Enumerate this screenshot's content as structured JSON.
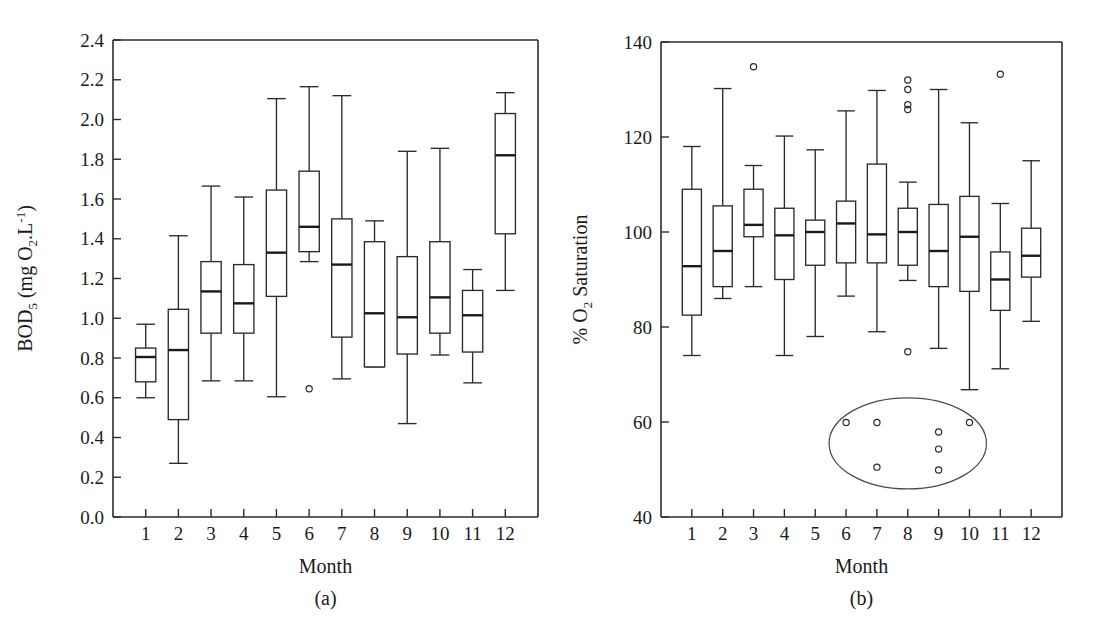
{
  "figure": {
    "background": "#ffffff",
    "ink_color": "#1a1a1a"
  },
  "chart_data": [
    {
      "type": "box",
      "panel_label": "(a)",
      "title": "",
      "xlabel": "Month",
      "ylabel": "BOD5 (mg O2.L-1)",
      "ylabel_parts": {
        "base": "BOD",
        "sub1": "5",
        "mid": " (mg O",
        "sub2": "2",
        "tail": ".L",
        "sup": "-1",
        "close": ")"
      },
      "categories": [
        "1",
        "2",
        "3",
        "4",
        "5",
        "6",
        "7",
        "8",
        "9",
        "10",
        "11",
        "12"
      ],
      "xtick_labels": [
        "1",
        "2",
        "3",
        "4",
        "5",
        "6",
        "7",
        "8",
        "9",
        "10",
        "11",
        "12"
      ],
      "ylim": [
        0.0,
        2.4
      ],
      "ytick_labels": [
        "0.0",
        "0.2",
        "0.4",
        "0.6",
        "0.8",
        "1.0",
        "1.2",
        "1.4",
        "1.6",
        "1.8",
        "2.0",
        "2.2",
        "2.4"
      ],
      "ytick_values": [
        0.0,
        0.2,
        0.4,
        0.6,
        0.8,
        1.0,
        1.2,
        1.4,
        1.6,
        1.8,
        2.0,
        2.2,
        2.4
      ],
      "grid": false,
      "legend": "none",
      "boxes": [
        {
          "category": "1",
          "whisker_low": 0.6,
          "q1": 0.68,
          "median": 0.805,
          "q3": 0.85,
          "whisker_high": 0.97,
          "outliers": []
        },
        {
          "category": "2",
          "whisker_low": 0.27,
          "q1": 0.49,
          "median": 0.84,
          "q3": 1.045,
          "whisker_high": 1.415,
          "outliers": []
        },
        {
          "category": "3",
          "whisker_low": 0.685,
          "q1": 0.925,
          "median": 1.135,
          "q3": 1.285,
          "whisker_high": 1.665,
          "outliers": []
        },
        {
          "category": "4",
          "whisker_low": 0.685,
          "q1": 0.925,
          "median": 1.075,
          "q3": 1.27,
          "whisker_high": 1.61,
          "outliers": []
        },
        {
          "category": "5",
          "whisker_low": 0.605,
          "q1": 1.11,
          "median": 1.33,
          "q3": 1.645,
          "whisker_high": 2.105,
          "outliers": []
        },
        {
          "category": "6",
          "whisker_low": 1.285,
          "q1": 1.335,
          "median": 1.46,
          "q3": 1.74,
          "whisker_high": 2.165,
          "outliers": [
            0.645
          ]
        },
        {
          "category": "7",
          "whisker_low": 0.695,
          "q1": 0.905,
          "median": 1.27,
          "q3": 1.5,
          "whisker_high": 2.12,
          "outliers": []
        },
        {
          "category": "8",
          "whisker_low": 0.755,
          "q1": 0.755,
          "median": 1.025,
          "q3": 1.385,
          "whisker_high": 1.49,
          "outliers": []
        },
        {
          "category": "9",
          "whisker_low": 0.47,
          "q1": 0.82,
          "median": 1.005,
          "q3": 1.31,
          "whisker_high": 1.84,
          "outliers": []
        },
        {
          "category": "10",
          "whisker_low": 0.815,
          "q1": 0.925,
          "median": 1.105,
          "q3": 1.385,
          "whisker_high": 1.855,
          "outliers": []
        },
        {
          "category": "11",
          "whisker_low": 0.675,
          "q1": 0.83,
          "median": 1.015,
          "q3": 1.14,
          "whisker_high": 1.245,
          "outliers": []
        },
        {
          "category": "12",
          "whisker_low": 1.14,
          "q1": 1.425,
          "median": 1.82,
          "q3": 2.03,
          "whisker_high": 2.135,
          "outliers": []
        }
      ],
      "annotations": []
    },
    {
      "type": "box",
      "panel_label": "(b)",
      "title": "",
      "xlabel": "Month",
      "ylabel": "% O2 Saturation",
      "ylabel_parts": {
        "base": "% O",
        "sub1": "2",
        "mid": " Saturation",
        "sub2": "",
        "tail": "",
        "sup": "",
        "close": ""
      },
      "categories": [
        "1",
        "2",
        "3",
        "4",
        "5",
        "6",
        "7",
        "8",
        "9",
        "10",
        "11",
        "12"
      ],
      "xtick_labels": [
        "1",
        "2",
        "3",
        "4",
        "5",
        "6",
        "7",
        "8",
        "9",
        "10",
        "11",
        "12"
      ],
      "ylim": [
        40,
        140
      ],
      "ytick_labels": [
        "40",
        "60",
        "80",
        "100",
        "120",
        "140"
      ],
      "ytick_values": [
        40,
        60,
        80,
        100,
        120,
        140
      ],
      "grid": false,
      "legend": "none",
      "boxes": [
        {
          "category": "1",
          "whisker_low": 74.0,
          "q1": 82.5,
          "median": 92.8,
          "q3": 109.0,
          "whisker_high": 118.0,
          "outliers": []
        },
        {
          "category": "2",
          "whisker_low": 86.0,
          "q1": 88.5,
          "median": 96.0,
          "q3": 105.5,
          "whisker_high": 130.2,
          "outliers": []
        },
        {
          "category": "3",
          "whisker_low": 88.5,
          "q1": 99.0,
          "median": 101.5,
          "q3": 109.0,
          "whisker_high": 114.0,
          "outliers": [
            134.8
          ]
        },
        {
          "category": "4",
          "whisker_low": 74.0,
          "q1": 90.0,
          "median": 99.3,
          "q3": 105.0,
          "whisker_high": 120.2,
          "outliers": []
        },
        {
          "category": "5",
          "whisker_low": 78.0,
          "q1": 93.0,
          "median": 100.0,
          "q3": 102.5,
          "whisker_high": 117.3,
          "outliers": []
        },
        {
          "category": "6",
          "whisker_low": 86.5,
          "q1": 93.5,
          "median": 101.8,
          "q3": 106.5,
          "whisker_high": 125.5,
          "outliers": []
        },
        {
          "category": "7",
          "whisker_low": 79.0,
          "q1": 93.5,
          "median": 99.5,
          "q3": 114.3,
          "whisker_high": 129.8,
          "outliers": []
        },
        {
          "category": "8",
          "whisker_low": 89.8,
          "q1": 93.0,
          "median": 100.0,
          "q3": 105.0,
          "whisker_high": 110.5,
          "outliers": [
            132.0,
            130.0,
            126.8,
            125.8,
            74.8
          ]
        },
        {
          "category": "9",
          "whisker_low": 75.5,
          "q1": 88.5,
          "median": 96.0,
          "q3": 105.8,
          "whisker_high": 130.0,
          "outliers": []
        },
        {
          "category": "10",
          "whisker_low": 66.8,
          "q1": 87.5,
          "median": 99.0,
          "q3": 107.5,
          "whisker_high": 123.0,
          "outliers": []
        },
        {
          "category": "11",
          "whisker_low": 71.2,
          "q1": 83.5,
          "median": 90.0,
          "q3": 95.8,
          "whisker_high": 106.0,
          "outliers": [
            133.2
          ]
        },
        {
          "category": "12",
          "whisker_low": 81.2,
          "q1": 90.5,
          "median": 95.0,
          "q3": 100.8,
          "whisker_high": 115.0,
          "outliers": []
        }
      ],
      "annotations": [
        {
          "kind": "ellipse",
          "name": "low-saturation-cluster-ellipse",
          "center_x_month": 8.0,
          "center_y": 55.5,
          "rx_months": 2.55,
          "ry_value": 9.6
        },
        {
          "kind": "point",
          "name": "cluster-point",
          "x_month": 6.0,
          "y": 59.9
        },
        {
          "kind": "point",
          "name": "cluster-point",
          "x_month": 7.0,
          "y": 59.9
        },
        {
          "kind": "point",
          "name": "cluster-point",
          "x_month": 7.0,
          "y": 50.5
        },
        {
          "kind": "point",
          "name": "cluster-point",
          "x_month": 9.0,
          "y": 57.9
        },
        {
          "kind": "point",
          "name": "cluster-point",
          "x_month": 9.0,
          "y": 54.3
        },
        {
          "kind": "point",
          "name": "cluster-point",
          "x_month": 9.0,
          "y": 49.9
        },
        {
          "kind": "point",
          "name": "cluster-point",
          "x_month": 10.0,
          "y": 59.9
        }
      ]
    }
  ]
}
